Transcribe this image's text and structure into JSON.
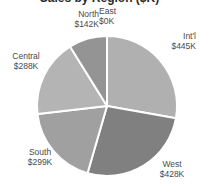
{
  "chart_data": {
    "type": "pie",
    "title": "Sales by Region ($K)",
    "categories": [
      "East",
      "Int'l",
      "West",
      "South",
      "Central",
      "North"
    ],
    "values": [
      0,
      445,
      428,
      299,
      288,
      142
    ],
    "value_labels": [
      "$0K",
      "$445K",
      "$428K",
      "$299K",
      "$288K",
      "$142K"
    ],
    "total": 1602,
    "unit": "K",
    "currency": "$",
    "legend": "none",
    "grid": false,
    "start_angle_deg": 0,
    "direction": "clockwise",
    "slice_colors": [
      "#7a7a7a",
      "#b0b0b0",
      "#808080",
      "#a0a0a0",
      "#b4b4b4",
      "#949494"
    ],
    "separator_color": "#ffffff",
    "slices": [
      {
        "name": "East",
        "value": 0,
        "label": "$0K",
        "color": "#7a7a7a",
        "percent": 0.0,
        "sweep_deg": 0.0
      },
      {
        "name": "Int'l",
        "value": 445,
        "label": "$445K",
        "color": "#b0b0b0",
        "percent": 27.8,
        "sweep_deg": 100.0
      },
      {
        "name": "West",
        "value": 428,
        "label": "$428K",
        "color": "#808080",
        "percent": 26.7,
        "sweep_deg": 96.2
      },
      {
        "name": "South",
        "value": 299,
        "label": "$299K",
        "color": "#a0a0a0",
        "percent": 18.7,
        "sweep_deg": 67.2
      },
      {
        "name": "Central",
        "value": 288,
        "label": "$288K",
        "color": "#b4b4b4",
        "percent": 18.0,
        "sweep_deg": 64.7
      },
      {
        "name": "North",
        "value": 142,
        "label": "$142K",
        "color": "#949494",
        "percent": 8.9,
        "sweep_deg": 31.9
      }
    ]
  },
  "labels": {
    "north": {
      "name": "North",
      "value": "$142K"
    },
    "east": {
      "name": "East",
      "value": "$0K"
    },
    "intl": {
      "name": "Int'l",
      "value": "$445K"
    },
    "west": {
      "name": "West",
      "value": "$428K"
    },
    "south": {
      "name": "South",
      "value": "$299K"
    },
    "central": {
      "name": "Central",
      "value": "$288K"
    }
  }
}
